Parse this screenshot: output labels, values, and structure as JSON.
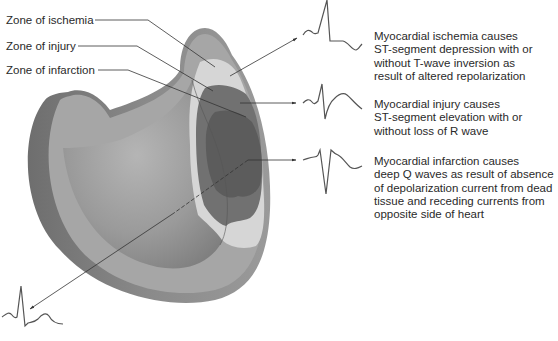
{
  "zone_labels": [
    {
      "id": "ischemia",
      "text": "Zone of ischemia"
    },
    {
      "id": "injury",
      "text": "Zone of injury"
    },
    {
      "id": "infarction",
      "text": "Zone of infarction"
    }
  ],
  "descriptions": [
    {
      "id": "ischemia",
      "lines": [
        "Myocardial ischemia causes",
        "ST-segment depression with or",
        "without T-wave inversion as",
        "result of altered repolarization"
      ]
    },
    {
      "id": "injury",
      "lines": [
        "Myocardial injury causes",
        "ST-segment elevation with or",
        "without loss of R wave"
      ]
    },
    {
      "id": "infarction",
      "lines": [
        "Myocardial infarction causes",
        "deep Q waves as result of absence",
        "of depolarization current from dead",
        "tissue and receding currents from",
        "opposite side of heart"
      ]
    }
  ],
  "ecg_traces": [
    {
      "id": "ischemia-ecg",
      "pattern": "ST depression / T-wave inversion"
    },
    {
      "id": "injury-ecg",
      "pattern": "ST elevation"
    },
    {
      "id": "infarction-ecg",
      "pattern": "deep Q wave"
    },
    {
      "id": "opposite-ecg",
      "pattern": "tall R wave (reciprocal)"
    }
  ],
  "colors": {
    "wall_outer": "#8e8e8e",
    "wall_cut": "#a9a9a9",
    "cavity": "#9c9c9c",
    "ischemia": "#d4d4d4",
    "injury": "#6f6f6f",
    "infarction": "#5a5a5a",
    "line": "#333333"
  }
}
